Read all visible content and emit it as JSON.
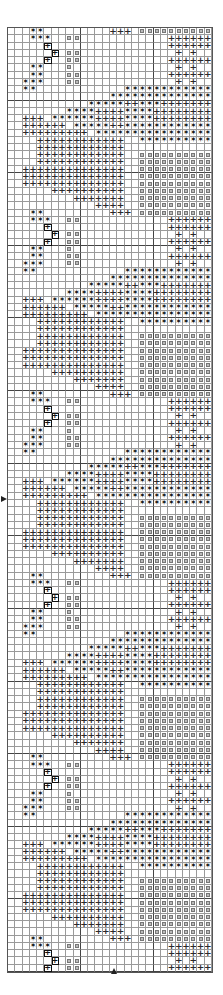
{
  "chart": {
    "title": "",
    "columns": 28,
    "rows": 130,
    "row_offset": 2,
    "legend": {
      "S": "dark-star-stitch",
      "P": "plus-stitch",
      "O": "dot-stitch",
      "B": "boxed-plus-stitch",
      ".": "empty"
    },
    "colors": {
      "grid_line": "#9a9a9a",
      "symbol": "#1a1a1a",
      "background": "#ffffff"
    },
    "markers": [
      {
        "name": "center-row-marker",
        "side": "left",
        "row": 64
      },
      {
        "name": "center-column-marker",
        "side": "bottom",
        "column": 14
      }
    ],
    "motif": [
      ".....B................PPPPPP",
      "......B.OO.............P.P..",
      ".....B..OO............PPPPPP",
      "...SS...O..............P.P..",
      "...SS...OO............PPPPPP",
      "..SSS...OO.............P.P..",
      "..SS............SSSSSSSSSSSS",
      "..............SSSSSSSSSSSSSS",
      "...........SSSSSPPSSSPPPPPPP",
      "........SSSSPPPPSSSSPPPPPPPP",
      "..PPP.SSSSSSPPPPSSSSPPPPPPPP",
      "..PPPPPP.SSSSSPPSSSSSSSSSSSS",
      "..PPPPPPPPP.SSSSSSSSSSSSSSSS",
      "....PPPPPPPPPPPP..SSSSSSSSSS",
      "....PPPPPPPPPPPP............",
      "....PPPPPPPPPPPP..OOOOOOOOOO",
      "....PPPPPPPPPPPP..OOOOOOOOOO",
      "..PPPPPPPPPPPPPP..OOOOOOOOOO",
      "..PPPPPPPPPPPPPP..OOOOOOOOOO",
      "..PPPPPPPPPPPPPP..OOOOOOOOOO",
      "......PPPPPPPPPP..OOOOOOOOOO",
      ".........PPPPPPP..OOOOOOOOOO",
      "............PPPP..OOOOOOOOOO",
      "...SS.........PPP.OOOOOOOOOO",
      "...SSS..OO............PPPPPP"
    ]
  }
}
